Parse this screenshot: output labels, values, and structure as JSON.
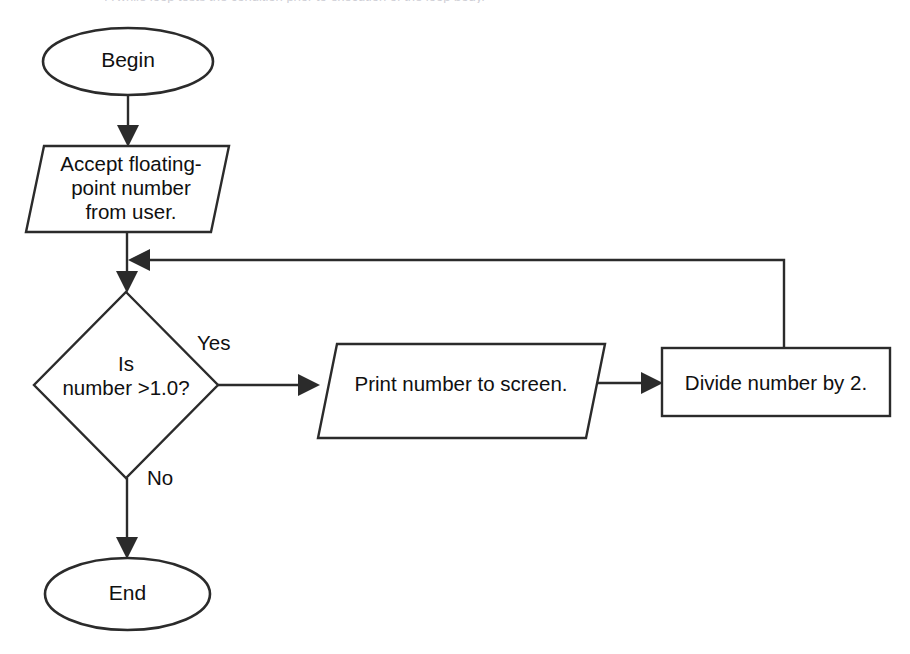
{
  "figure": {
    "kind": "flowchart",
    "title_strip": "A while loop tests the condition prior to execution of the loop body.",
    "background_color": "#ffffff",
    "line_color": "#2b2b2b",
    "text_color": "#101010"
  },
  "nodes": [
    {
      "id": "begin",
      "shape": "ellipse",
      "label": "Begin"
    },
    {
      "id": "accept",
      "shape": "parallelogram",
      "label": "Accept floating-\npoint number\nfrom user."
    },
    {
      "id": "decision",
      "shape": "diamond",
      "label": "Is\nnumber >1.0?"
    },
    {
      "id": "print",
      "shape": "parallelogram",
      "label": "Print number to screen."
    },
    {
      "id": "divide",
      "shape": "rectangle",
      "label": "Divide number by 2."
    },
    {
      "id": "end",
      "shape": "ellipse",
      "label": "End"
    }
  ],
  "edges": [
    {
      "id": "begin-to-accept",
      "from": "begin",
      "to": "accept",
      "label": ""
    },
    {
      "id": "accept-to-decision",
      "from": "accept",
      "to": "decision",
      "label": ""
    },
    {
      "id": "decision-to-print",
      "from": "decision",
      "to": "print",
      "label": "Yes"
    },
    {
      "id": "print-to-divide",
      "from": "print",
      "to": "divide",
      "label": ""
    },
    {
      "id": "divide-to-decision",
      "from": "divide",
      "to": "decision",
      "label": ""
    },
    {
      "id": "decision-to-end",
      "from": "decision",
      "to": "end",
      "label": "No"
    }
  ],
  "edge_labels": {
    "yes": "Yes",
    "no": "No"
  }
}
